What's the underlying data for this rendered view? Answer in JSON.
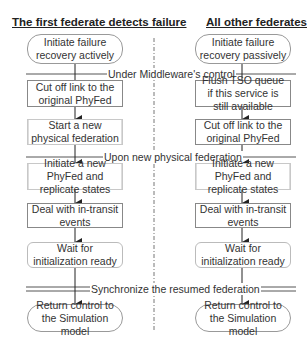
{
  "left_column": {
    "header": "The first federate detects failure",
    "steps": [
      "Initiate failure recovery actively",
      "Cut off link to the original PhyFed",
      "Start a new physical federation",
      "Initiate  a new PhyFed and replicate states",
      "Deal with in-transit events",
      "Wait for initialization ready",
      "Return control to the Simulation model"
    ]
  },
  "right_column": {
    "header": "All other federates",
    "steps": [
      "Initiate failure recovery passively",
      "Flush TSO queue if this service is still available",
      "Cut off link to the original PhyFed",
      "Initiate a new PhyFed and replicate states",
      "Deal with in-transit events",
      "Wait for initialization ready",
      "Return control to the Simulation model"
    ]
  },
  "phase_labels": {
    "middleware": "Under Middleware's control",
    "new_federation": "Upon new physical federation",
    "synchronize": "Synchronize the resumed federation"
  },
  "colors": {
    "line": "#333333",
    "box_border": "#888888",
    "text": "#333333"
  }
}
